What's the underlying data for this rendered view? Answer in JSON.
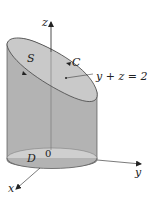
{
  "figure": {
    "type": "3d-surface-diagram",
    "labels": {
      "z_axis": "z",
      "y_axis": "y",
      "x_axis": "x",
      "surface": "S",
      "curve": "C",
      "plane_equation": "y + z = 2",
      "region": "D",
      "origin": "0"
    },
    "colors": {
      "cylinder_side": "#b5b5b5",
      "top_surface": "#c8c8c8",
      "bottom_region": "#d0d0d0",
      "lines": "#333333"
    }
  }
}
